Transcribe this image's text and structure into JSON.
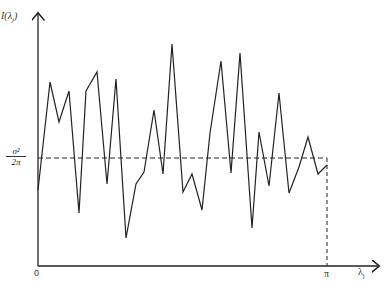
{
  "chart_data": {
    "type": "line",
    "title": "",
    "xlabel": "λ_j",
    "ylabel": "I(λ_j)",
    "x_ticks": [
      "0",
      "π"
    ],
    "reference_line": {
      "label": "σ²/2π",
      "style": "dashed",
      "value_px_y": 158
    },
    "xlim": [
      0,
      3.14159
    ],
    "grid": false,
    "legend": null,
    "x": [
      0.0,
      0.1,
      0.2,
      0.3,
      0.4,
      0.47,
      0.58,
      0.69,
      0.78,
      0.89,
      0.99,
      1.08,
      1.18,
      1.27,
      1.36,
      1.48,
      1.57,
      1.67,
      1.75,
      1.87,
      1.97,
      2.07,
      2.18,
      2.25,
      2.36,
      2.47,
      2.58,
      2.68,
      2.77,
      2.88,
      2.98
    ],
    "values": [
      0.75,
      1.77,
      1.34,
      1.67,
      0.43,
      1.67,
      1.88,
      0.81,
      1.8,
      0.27,
      0.81,
      0.94,
      1.6,
      0.91,
      2.18,
      0.72,
      0.91,
      0.52,
      1.36,
      2.0,
      0.92,
      2.09,
      0.4,
      1.38,
      0.78,
      1.76,
      0.7,
      0.99,
      1.31,
      0.91,
      1.0
    ],
    "reference_value": 1.0,
    "points_px": [
      [
        38,
        190
      ],
      [
        50,
        82
      ],
      [
        59,
        122
      ],
      [
        69,
        91
      ],
      [
        79,
        213
      ],
      [
        86,
        91
      ],
      [
        97,
        72
      ],
      [
        107,
        184
      ],
      [
        116,
        79
      ],
      [
        126,
        238
      ],
      [
        136,
        184
      ],
      [
        144,
        172
      ],
      [
        154,
        110
      ],
      [
        163,
        174
      ],
      [
        172,
        44
      ],
      [
        183,
        192
      ],
      [
        192,
        174
      ],
      [
        202,
        210
      ],
      [
        210,
        133
      ],
      [
        221,
        61
      ],
      [
        231,
        173
      ],
      [
        240,
        53
      ],
      [
        252,
        228
      ],
      [
        259,
        132
      ],
      [
        269,
        186
      ],
      [
        279,
        93
      ],
      [
        289,
        193
      ],
      [
        299,
        167
      ],
      [
        308,
        137
      ],
      [
        318,
        174
      ],
      [
        327,
        165
      ]
    ]
  },
  "labels": {
    "y_axis": "I(λ",
    "y_axis_sub": "j",
    "y_axis_close": ")",
    "ref_num": "σ²",
    "ref_den": "2π",
    "x_origin": "0",
    "x_pi": "π",
    "x_axis": "λ",
    "x_axis_sub": "j"
  }
}
